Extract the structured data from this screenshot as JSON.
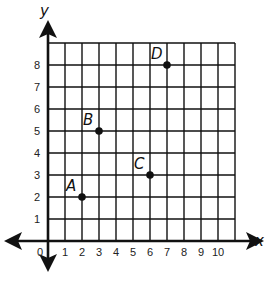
{
  "chart_data": {
    "type": "scatter",
    "title": "",
    "xlabel": "x",
    "ylabel": "y",
    "xlim": [
      0,
      11
    ],
    "ylim": [
      0,
      9
    ],
    "grid": true,
    "x_ticks": [
      "1",
      "2",
      "3",
      "4",
      "5",
      "6",
      "7",
      "8",
      "9",
      "10"
    ],
    "y_ticks": [
      "1",
      "2",
      "3",
      "4",
      "5",
      "6",
      "7",
      "8"
    ],
    "origin_label": "0",
    "points": [
      {
        "label": "A",
        "x": 2,
        "y": 2
      },
      {
        "label": "B",
        "x": 3,
        "y": 5
      },
      {
        "label": "C",
        "x": 6,
        "y": 3
      },
      {
        "label": "D",
        "x": 7,
        "y": 8
      }
    ]
  },
  "colors": {
    "ink": "#111111",
    "background": "#ffffff"
  }
}
